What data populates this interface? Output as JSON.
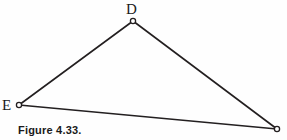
{
  "figure": {
    "caption": "Figure 4.33.",
    "background_color": "#fefefe",
    "stroke_color": "#231f20",
    "width": 287,
    "height": 140
  },
  "diagram": {
    "type": "triangle",
    "vertices": [
      {
        "id": "D",
        "label": "D",
        "x": 133,
        "y": 21,
        "label_x": 126,
        "label_y": 2
      },
      {
        "id": "E",
        "label": "E",
        "x": 19,
        "y": 105,
        "label_x": 2,
        "label_y": 98
      },
      {
        "id": "C",
        "label": "",
        "x": 277,
        "y": 129,
        "label_x": 0,
        "label_y": 0
      }
    ],
    "edges": [
      {
        "from": "E",
        "to": "D"
      },
      {
        "from": "D",
        "to": "C"
      },
      {
        "from": "E",
        "to": "C"
      }
    ],
    "vertex_marker": {
      "shape": "circle",
      "radius": 2.6,
      "fill": "#ffffff",
      "stroke": "#231f20",
      "stroke_width": 1.3
    },
    "edge_stroke_width": 1.6
  }
}
